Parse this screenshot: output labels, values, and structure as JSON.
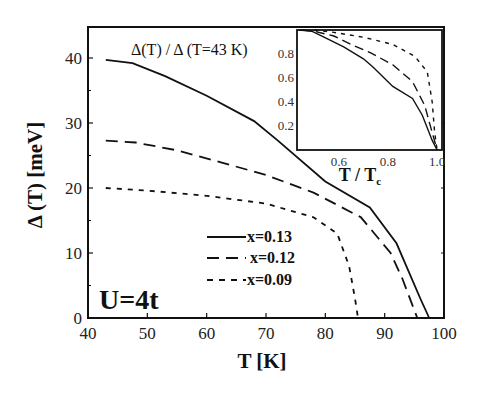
{
  "chart_data": {
    "type": "line",
    "title": "",
    "xlabel": "T [K]",
    "ylabel": "Δ (T) [meV]",
    "xlim": [
      40,
      100
    ],
    "ylim": [
      0,
      45
    ],
    "xticks": [
      40,
      50,
      60,
      70,
      80,
      90,
      100
    ],
    "yticks": [
      0,
      10,
      20,
      30,
      40
    ],
    "grid": false,
    "legend_position": "lower-center",
    "annotations": [
      "U=4t",
      "Δ(T) / Δ (T=43 K)"
    ],
    "series": [
      {
        "name": "x=0.13",
        "style": "solid",
        "x": [
          43,
          47.5,
          53,
          60,
          68,
          72,
          80,
          87.5,
          92,
          96,
          97.5
        ],
        "y": [
          39.7,
          39.2,
          37.2,
          34.2,
          30.3,
          27.3,
          21,
          17,
          11.5,
          3,
          0
        ]
      },
      {
        "name": "x=0.12",
        "style": "dashed",
        "x": [
          43,
          48,
          55,
          63,
          70,
          78,
          86,
          91,
          93,
          95.5
        ],
        "y": [
          27.3,
          27,
          25.8,
          23.8,
          22,
          19.3,
          15.5,
          10,
          6,
          0
        ]
      },
      {
        "name": "x=0.09",
        "style": "dotted",
        "x": [
          43,
          50,
          60,
          70,
          78,
          82,
          84,
          85,
          85.5
        ],
        "y": [
          20,
          19.6,
          18.8,
          17.6,
          15.5,
          13,
          8,
          3,
          0
        ]
      }
    ],
    "inset": {
      "type": "line",
      "title": "Δ(T) / Δ (T=43 K)",
      "xlabel": "T / Tc",
      "ylabel": "",
      "xlim": [
        0.43,
        1.02
      ],
      "ylim": [
        0,
        1.0
      ],
      "xticks": [
        0.6,
        0.8,
        1.0
      ],
      "yticks": [
        0.2,
        0.4,
        0.6,
        0.8
      ],
      "series": [
        {
          "name": "x=0.13",
          "style": "solid",
          "x": [
            0.44,
            0.49,
            0.54,
            0.62,
            0.7,
            0.74,
            0.82,
            0.9,
            0.94,
            0.98,
            1.0
          ],
          "y": [
            1.0,
            0.99,
            0.94,
            0.86,
            0.76,
            0.69,
            0.53,
            0.43,
            0.29,
            0.08,
            0.0
          ]
        },
        {
          "name": "x=0.12",
          "style": "dashed",
          "x": [
            0.45,
            0.5,
            0.58,
            0.66,
            0.73,
            0.82,
            0.9,
            0.95,
            0.97,
            1.0
          ],
          "y": [
            1.0,
            0.99,
            0.95,
            0.87,
            0.81,
            0.71,
            0.57,
            0.37,
            0.22,
            0.0
          ]
        },
        {
          "name": "x=0.09",
          "style": "dotted",
          "x": [
            0.5,
            0.58,
            0.7,
            0.82,
            0.91,
            0.96,
            0.98,
            0.99,
            1.0
          ],
          "y": [
            1.0,
            0.98,
            0.94,
            0.88,
            0.78,
            0.65,
            0.4,
            0.15,
            0.0
          ]
        }
      ]
    }
  },
  "labels": {
    "xlabel": "T [K]",
    "ylabel": "Δ (T) [meV]",
    "u_label": "U=4t",
    "inset_title": "Δ(T) / Δ (T=43 K)",
    "inset_xlabel_main": "T / T",
    "inset_xlabel_sub": "c",
    "legend": [
      "x=0.13",
      "x=0.12",
      "x=0.09"
    ],
    "xticks": [
      "40",
      "50",
      "60",
      "70",
      "80",
      "90",
      "100"
    ],
    "yticks": [
      "0",
      "10",
      "20",
      "30",
      "40"
    ],
    "inset_xticks": [
      "0.6",
      "0.8",
      "1.0"
    ],
    "inset_yticks": [
      "0.2",
      "0.4",
      "0.6",
      "0.8"
    ]
  }
}
